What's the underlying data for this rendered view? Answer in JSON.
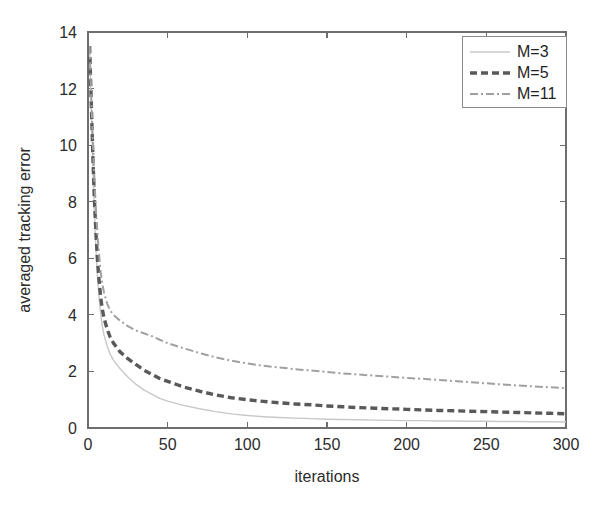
{
  "chart_data": {
    "type": "line",
    "title": "",
    "xlabel": "iterations",
    "ylabel": "averaged tracking error",
    "xlim": [
      0,
      300
    ],
    "ylim": [
      0,
      14
    ],
    "xticks": [
      0,
      50,
      100,
      150,
      200,
      250,
      300
    ],
    "yticks": [
      0,
      2,
      4,
      6,
      8,
      10,
      12,
      14
    ],
    "grid": false,
    "legend_position": "top-right",
    "x": [
      1,
      2,
      3,
      4,
      5,
      6,
      7,
      8,
      9,
      10,
      12,
      14,
      16,
      18,
      20,
      25,
      30,
      35,
      40,
      45,
      50,
      60,
      70,
      80,
      90,
      100,
      110,
      120,
      130,
      140,
      150,
      160,
      170,
      180,
      190,
      200,
      210,
      220,
      230,
      240,
      250,
      260,
      270,
      280,
      290,
      300
    ],
    "series": [
      {
        "name": "M=3",
        "color": "#c8c8c8",
        "style": "solid-thin",
        "values": [
          13.5,
          11.4,
          9.3,
          7.6,
          6.3,
          5.3,
          4.6,
          4.0,
          3.6,
          3.3,
          2.9,
          2.6,
          2.4,
          2.25,
          2.1,
          1.8,
          1.55,
          1.35,
          1.2,
          1.05,
          0.95,
          0.8,
          0.68,
          0.58,
          0.5,
          0.44,
          0.4,
          0.37,
          0.35,
          0.33,
          0.31,
          0.3,
          0.29,
          0.28,
          0.27,
          0.26,
          0.26,
          0.25,
          0.25,
          0.24,
          0.24,
          0.23,
          0.23,
          0.22,
          0.22,
          0.21
        ]
      },
      {
        "name": "M=5",
        "color": "#595959",
        "style": "dashed-thick",
        "values": [
          13.5,
          11.6,
          9.7,
          8.1,
          6.9,
          5.9,
          5.2,
          4.6,
          4.2,
          3.9,
          3.5,
          3.2,
          3.0,
          2.85,
          2.7,
          2.45,
          2.25,
          2.05,
          1.9,
          1.75,
          1.65,
          1.45,
          1.3,
          1.17,
          1.07,
          1.0,
          0.94,
          0.89,
          0.85,
          0.82,
          0.78,
          0.75,
          0.72,
          0.7,
          0.68,
          0.66,
          0.64,
          0.62,
          0.61,
          0.59,
          0.58,
          0.56,
          0.55,
          0.53,
          0.52,
          0.5
        ]
      },
      {
        "name": "M=11",
        "color": "#a0a0a0",
        "style": "dash-dot",
        "values": [
          13.5,
          11.8,
          10.2,
          8.8,
          7.7,
          6.8,
          6.1,
          5.5,
          5.1,
          4.8,
          4.4,
          4.15,
          4.0,
          3.9,
          3.8,
          3.6,
          3.45,
          3.35,
          3.25,
          3.12,
          3.0,
          2.82,
          2.65,
          2.5,
          2.38,
          2.28,
          2.2,
          2.14,
          2.08,
          2.03,
          1.98,
          1.93,
          1.89,
          1.85,
          1.81,
          1.77,
          1.74,
          1.7,
          1.66,
          1.62,
          1.58,
          1.54,
          1.5,
          1.47,
          1.44,
          1.41
        ]
      }
    ],
    "legend": [
      "M=3",
      "M=5",
      "M=11"
    ]
  },
  "figure": {
    "background": "#ffffff",
    "axis_color": "#6e6e6e",
    "text_color": "#2b2b2b"
  }
}
